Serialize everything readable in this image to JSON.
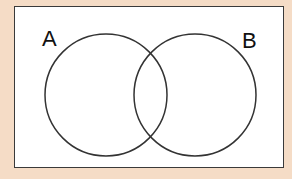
{
  "diagram": {
    "type": "venn",
    "sets": [
      {
        "label": "A",
        "cx": 106,
        "cy": 95,
        "r": 61
      },
      {
        "label": "B",
        "cx": 195,
        "cy": 95,
        "r": 61
      }
    ],
    "colors": {
      "background": "#f5dcc6",
      "frame": "#ffffff",
      "stroke": "#333333"
    }
  }
}
